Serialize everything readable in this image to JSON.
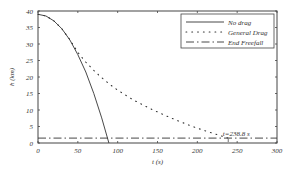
{
  "chart_data": {
    "type": "line",
    "title": "",
    "xlabel": "t (s)",
    "ylabel": "h (km)",
    "xlim": [
      0,
      300
    ],
    "ylim": [
      0,
      40
    ],
    "xticks": [
      0,
      50,
      100,
      150,
      200,
      250,
      300
    ],
    "yticks": [
      0,
      5,
      10,
      15,
      20,
      25,
      30,
      35,
      40
    ],
    "legend_position": "upper right",
    "series": [
      {
        "name": "No drag",
        "style": "solid",
        "x": [
          0,
          10,
          20,
          30,
          40,
          50,
          60,
          70,
          80,
          89
        ],
        "y": [
          39,
          38.5,
          37,
          34.6,
          31.2,
          26.8,
          21.5,
          15.0,
          7.6,
          0
        ]
      },
      {
        "name": "General Drag",
        "style": "dotted",
        "x": [
          0,
          10,
          20,
          30,
          40,
          50,
          60,
          70,
          80,
          90,
          100,
          120,
          140,
          160,
          180,
          200,
          220,
          238.8
        ],
        "y": [
          39,
          38.5,
          37,
          34.6,
          31.3,
          27.5,
          24.5,
          22.0,
          19.8,
          17.8,
          16.0,
          13.0,
          10.5,
          8.3,
          6.3,
          4.5,
          2.9,
          1.5
        ]
      },
      {
        "name": "End Freefall",
        "style": "dashdot",
        "x": [
          0,
          300
        ],
        "y": [
          1.5,
          1.5
        ]
      }
    ],
    "annotations": [
      {
        "text": "t=238.8 s",
        "x": 238.8,
        "y": 1.5
      }
    ]
  },
  "legend": {
    "items": [
      "No drag",
      "General Drag",
      "End Freefall"
    ]
  },
  "annotation_text": "t=238.8 s"
}
